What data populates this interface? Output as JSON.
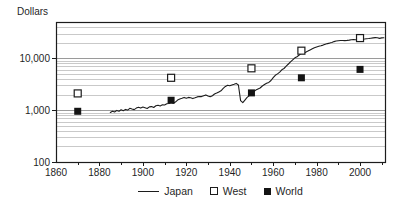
{
  "figure": {
    "y_axis_unit_label": "Dollars"
  },
  "colors": {
    "line": "#1c1c1c",
    "text": "#1f1f1f",
    "grid_major": "#9a9a9a",
    "grid_minor": "#c9c9c9",
    "marker_fill": "#141414",
    "marker_open_fill": "#ffffff",
    "background": "#ffffff"
  },
  "chart_data": {
    "type": "line",
    "title": "",
    "ylabel": "Dollars",
    "xlabel": "",
    "y_scale": "log",
    "ylim": [
      100,
      50000
    ],
    "xlim": [
      1860,
      2011.5
    ],
    "grid": {
      "horizontal": true,
      "log_minor_lines": true,
      "vertical": false
    },
    "legend_position": "bottom",
    "x_tick_values": [
      1860,
      1880,
      1900,
      1920,
      1940,
      1960,
      1980,
      2000
    ],
    "x_tick_labels": [
      "1860",
      "1880",
      "1900",
      "1920",
      "1940",
      "1960",
      "1980",
      "2000"
    ],
    "x_minor_tick_interval": 10,
    "y_ticks": [
      {
        "value": 100,
        "label": "100"
      },
      {
        "value": 1000,
        "label": "1,000"
      },
      {
        "value": 10000,
        "label": "10,000"
      }
    ],
    "series": [
      {
        "name": "Japan",
        "type": "line",
        "color": "#1c1c1c",
        "points": [
          [
            1885,
            900
          ],
          [
            1886,
            950
          ],
          [
            1887,
            920
          ],
          [
            1888,
            990
          ],
          [
            1889,
            955
          ],
          [
            1890,
            1020
          ],
          [
            1891,
            975
          ],
          [
            1892,
            1035
          ],
          [
            1893,
            1000
          ],
          [
            1894,
            1085
          ],
          [
            1895,
            1050
          ],
          [
            1896,
            1025
          ],
          [
            1897,
            1095
          ],
          [
            1898,
            1140
          ],
          [
            1899,
            1095
          ],
          [
            1900,
            1145
          ],
          [
            1901,
            1110
          ],
          [
            1902,
            1075
          ],
          [
            1903,
            1155
          ],
          [
            1904,
            1170
          ],
          [
            1905,
            1125
          ],
          [
            1906,
            1210
          ],
          [
            1907,
            1245
          ],
          [
            1908,
            1205
          ],
          [
            1909,
            1265
          ],
          [
            1910,
            1255
          ],
          [
            1911,
            1325
          ],
          [
            1912,
            1345
          ],
          [
            1913,
            1420
          ],
          [
            1914,
            1360
          ],
          [
            1915,
            1430
          ],
          [
            1916,
            1560
          ],
          [
            1917,
            1630
          ],
          [
            1918,
            1690
          ],
          [
            1919,
            1760
          ],
          [
            1920,
            1690
          ],
          [
            1921,
            1760
          ],
          [
            1922,
            1730
          ],
          [
            1923,
            1670
          ],
          [
            1924,
            1730
          ],
          [
            1925,
            1800
          ],
          [
            1926,
            1830
          ],
          [
            1927,
            1820
          ],
          [
            1928,
            1900
          ],
          [
            1929,
            1970
          ],
          [
            1930,
            1870
          ],
          [
            1931,
            1810
          ],
          [
            1932,
            1900
          ],
          [
            1933,
            2050
          ],
          [
            1934,
            2130
          ],
          [
            1935,
            2250
          ],
          [
            1936,
            2360
          ],
          [
            1937,
            2620
          ],
          [
            1938,
            2870
          ],
          [
            1939,
            3010
          ],
          [
            1940,
            2940
          ],
          [
            1941,
            3070
          ],
          [
            1942,
            3160
          ],
          [
            1943,
            3270
          ],
          [
            1944,
            3050
          ],
          [
            1945,
            1520
          ],
          [
            1946,
            1390
          ],
          [
            1947,
            1560
          ],
          [
            1948,
            1760
          ],
          [
            1949,
            1910
          ],
          [
            1950,
            2080
          ],
          [
            1951,
            2270
          ],
          [
            1952,
            2430
          ],
          [
            1953,
            2570
          ],
          [
            1954,
            2670
          ],
          [
            1955,
            2920
          ],
          [
            1956,
            3120
          ],
          [
            1957,
            3310
          ],
          [
            1958,
            3420
          ],
          [
            1959,
            3720
          ],
          [
            1960,
            4210
          ],
          [
            1961,
            4690
          ],
          [
            1962,
            4990
          ],
          [
            1963,
            5410
          ],
          [
            1964,
            5990
          ],
          [
            1965,
            6340
          ],
          [
            1966,
            7040
          ],
          [
            1967,
            7740
          ],
          [
            1968,
            8550
          ],
          [
            1969,
            9350
          ],
          [
            1970,
            10200
          ],
          [
            1971,
            10720
          ],
          [
            1972,
            11580
          ],
          [
            1973,
            12630
          ],
          [
            1974,
            12540
          ],
          [
            1975,
            13080
          ],
          [
            1976,
            13710
          ],
          [
            1977,
            14480
          ],
          [
            1978,
            15230
          ],
          [
            1979,
            16010
          ],
          [
            1980,
            16530
          ],
          [
            1981,
            17070
          ],
          [
            1982,
            17480
          ],
          [
            1983,
            17920
          ],
          [
            1984,
            18590
          ],
          [
            1985,
            19180
          ],
          [
            1986,
            19590
          ],
          [
            1987,
            20180
          ],
          [
            1988,
            20980
          ],
          [
            1989,
            21480
          ],
          [
            1990,
            21820
          ],
          [
            1991,
            22010
          ],
          [
            1992,
            21990
          ],
          [
            1993,
            21880
          ],
          [
            1994,
            22110
          ],
          [
            1995,
            22400
          ],
          [
            1996,
            22790
          ],
          [
            1997,
            23010
          ],
          [
            1998,
            22690
          ],
          [
            1999,
            22830
          ],
          [
            2000,
            23190
          ],
          [
            2001,
            23290
          ],
          [
            2002,
            23510
          ],
          [
            2003,
            23790
          ],
          [
            2004,
            24090
          ],
          [
            2005,
            24410
          ],
          [
            2006,
            24710
          ],
          [
            2007,
            24980
          ],
          [
            2008,
            24790
          ],
          [
            2009,
            24190
          ],
          [
            2010,
            24680
          ],
          [
            2011,
            24900
          ]
        ]
      },
      {
        "name": "West",
        "type": "scatter",
        "marker": "open-square",
        "color": "#1c1c1c",
        "points": [
          [
            1870,
            2100
          ],
          [
            1913,
            4200
          ],
          [
            1950,
            6400
          ],
          [
            1973,
            14000
          ],
          [
            2000,
            24500
          ]
        ]
      },
      {
        "name": "World",
        "type": "scatter",
        "marker": "filled-square",
        "color": "#141414",
        "points": [
          [
            1870,
            950
          ],
          [
            1913,
            1550
          ],
          [
            1950,
            2150
          ],
          [
            1973,
            4200
          ],
          [
            2000,
            6100
          ]
        ]
      }
    ]
  }
}
